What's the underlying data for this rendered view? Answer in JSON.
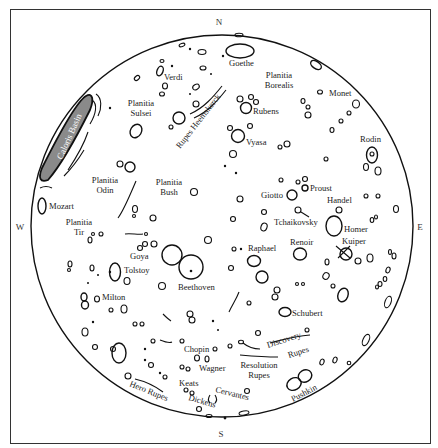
{
  "map": {
    "title": "Mercury surface features",
    "compass": {
      "north": "N",
      "south": "S",
      "east": "E",
      "west": "W"
    },
    "colors": {
      "ink": "#111111",
      "frame": "#333333",
      "basin_fill": "#888888",
      "background": "#ffffff"
    },
    "regions": {
      "caloris": "Caloris Basin",
      "sulsei": [
        "Planitia",
        "Sulsei"
      ],
      "borealis": [
        "Planitia",
        "Borealis"
      ],
      "odin": [
        "Planitia",
        "Odin"
      ],
      "bush": [
        "Planitia",
        "Bush"
      ],
      "tir": [
        "Planitia",
        "Tir"
      ]
    },
    "rupes": {
      "heemskerck": "Rupes Heemskerck",
      "hero": "Hero Rupes",
      "discovery": [
        "Discovery",
        "Rupes"
      ],
      "resolution": [
        "Resolution",
        "Rupes"
      ]
    },
    "craters": {
      "goethe": "Goethe",
      "verdi": "Verdi",
      "monet": "Monet",
      "rubens": "Rubens",
      "vyasa": "Vyasa",
      "rodin": "Rodin",
      "mozart": "Mozart",
      "giotto": "Giotto",
      "proust": "Proust",
      "handel": "Handel",
      "tchaikovsky": "Tchaikovsky",
      "homer": "Homer",
      "kuiper": "Kuiper",
      "goya": "Goya",
      "tolstoy": "Tolstoy",
      "raphael": "Raphael",
      "renoir": "Renoir",
      "beethoven": "Beethoven",
      "milton": "Milton",
      "schubert": "Schubert",
      "chopin": "Chopin",
      "wagner": "Wagner",
      "keats": "Keats",
      "dickens": "Dickens",
      "cervantes": "Cervantes",
      "pushkin": "Pushkin"
    }
  }
}
